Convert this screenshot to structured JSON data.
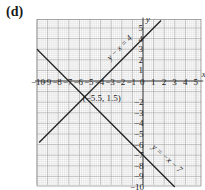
{
  "panel_label": "(d)",
  "chart_data": {
    "type": "line",
    "title": "(d)",
    "xlabel": "x",
    "ylabel": "y",
    "xlim": [
      -10,
      5.5
    ],
    "ylim": [
      -9.8,
      5.8
    ],
    "grid": true,
    "x_ticks": [
      -10,
      -9,
      -8,
      -7,
      -6,
      -5,
      -4,
      -3,
      -2,
      -1,
      0,
      1,
      2,
      3,
      4,
      5
    ],
    "x_tick_labels": [
      "−10",
      "9",
      "8",
      "7",
      "6",
      "5",
      "4",
      "3",
      "2",
      "1",
      "0",
      "1",
      "2",
      "3",
      "4",
      "5"
    ],
    "y_ticks": [
      5,
      4,
      3,
      2,
      1,
      -2,
      -3,
      -4,
      -5,
      -6,
      -7,
      -8,
      -9,
      -10
    ],
    "y_tick_labels": [
      "5",
      "4",
      "3",
      "2",
      "1",
      "−2",
      "−3",
      "−4",
      "−5",
      "−6",
      "−7",
      "−8",
      "−9",
      "−10"
    ],
    "series": [
      {
        "name": "y − x = 4",
        "equation": "y = x + 4",
        "x": [
          -9.8,
          1.7
        ],
        "y": [
          -5.8,
          5.7
        ]
      },
      {
        "name": "y = −x − 7",
        "equation": "y = -x - 7",
        "x": [
          -10,
          3.0
        ],
        "y": [
          3.0,
          -10.0
        ]
      }
    ],
    "annotations": [
      {
        "text": "(−5.5, 1.5)",
        "x": -5.5,
        "y": -1.5,
        "note": "intersection point label"
      }
    ]
  }
}
